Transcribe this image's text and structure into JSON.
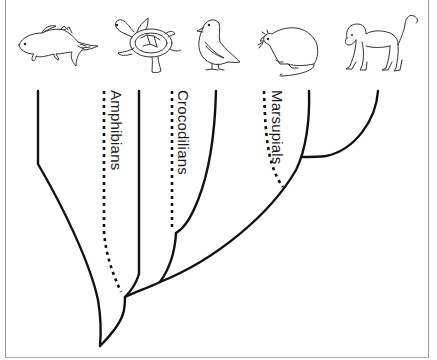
{
  "diagram": {
    "type": "cladogram",
    "animals": [
      {
        "id": "fish",
        "icon": "fish-icon",
        "label": ""
      },
      {
        "id": "turtle",
        "icon": "turtle-icon",
        "label": ""
      },
      {
        "id": "bird",
        "icon": "bird-icon",
        "label": ""
      },
      {
        "id": "rat",
        "icon": "rat-icon",
        "label": ""
      },
      {
        "id": "monkey",
        "icon": "monkey-icon",
        "label": ""
      }
    ],
    "dotted_lineage_labels": {
      "amphibians": "Amphibians",
      "crocodilians": "Crocodilians",
      "marsupials": "Marsupials"
    },
    "line_color": "#111111",
    "background": "#ffffff"
  }
}
